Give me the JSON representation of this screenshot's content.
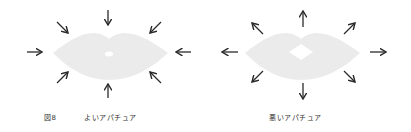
{
  "figure_number": "図8",
  "panels": [
    {
      "id": "good",
      "caption": "よいアパチュア",
      "arrow_direction": "inward",
      "opening": "small"
    },
    {
      "id": "bad",
      "caption": "悪いアパチュア",
      "arrow_direction": "outward",
      "opening": "large"
    }
  ],
  "colors": {
    "lips": "#ebebeb",
    "arrow": "#2a2a2a",
    "caption": "#333333",
    "background": "#ffffff"
  }
}
